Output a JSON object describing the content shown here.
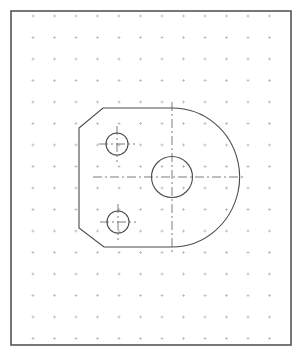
{
  "sheet": {
    "title": "Isometric dot-grid drawing sheet",
    "width": 303,
    "height": 359,
    "background_color": "#ffffff",
    "border": {
      "name": "sheet-border",
      "x": 11,
      "y": 11,
      "width": 280,
      "height": 334,
      "stroke_color": "#555555",
      "stroke_width": 1.6,
      "fill": "none"
    },
    "grid": {
      "name": "dot-grid",
      "marker": "plus-tick",
      "origin_x": 33,
      "origin_y": 16,
      "spacing_x": 21.5,
      "spacing_y": 21.5,
      "columns": 12,
      "rows": 16,
      "tick_length": 3,
      "stroke_color": "#b9b9b9",
      "stroke_width": 0.8
    }
  },
  "drawing": {
    "name": "d-shaped-bracket-plate",
    "line_color": "#4a4a4a",
    "line_width": 1.1,
    "center_line_color": "#6e6e6e",
    "center_line_width": 0.9,
    "center_line_dash": "9 3 2 3",
    "outline": {
      "name": "part-outline",
      "description": "Chamfered rectangle on the left closed by a large D arc on the right",
      "path": "M 103 108 L 172 108 C 205 108 231 131 238 162 C 240 171 240 183 238 192 C 231 223 205 247 172 247 L 104 247 L 79 228 L 79 128 Z",
      "vertices": [
        [
          103,
          108
        ],
        [
          172,
          108
        ],
        [
          238,
          177
        ],
        [
          172,
          247
        ],
        [
          104,
          247
        ],
        [
          79,
          228
        ],
        [
          79,
          128
        ]
      ],
      "top_edge_y": 108,
      "bottom_edge_y": 247,
      "left_edge_x": 79,
      "right_extreme_x": 240,
      "chamfer_top_left": {
        "from": [
          79,
          128
        ],
        "to": [
          103,
          108
        ]
      },
      "chamfer_bottom_left": {
        "from": [
          79,
          228
        ],
        "to": [
          104,
          247
        ]
      }
    },
    "circles": [
      {
        "name": "center-bore",
        "role": "main-bore",
        "cx": 172,
        "cy": 177,
        "r": 20.5
      },
      {
        "name": "upper-mounting-hole",
        "role": "fastener-hole",
        "cx": 117,
        "cy": 144,
        "r": 11
      },
      {
        "name": "lower-mounting-hole",
        "role": "fastener-hole",
        "cx": 118,
        "cy": 222,
        "r": 11
      }
    ],
    "center_lines": [
      {
        "name": "main-horizontal-centerline",
        "orientation": "horizontal",
        "x1": 93,
        "y1": 177,
        "x2": 243,
        "y2": 177
      },
      {
        "name": "main-vertical-centerline",
        "orientation": "vertical",
        "x1": 172,
        "y1": 102,
        "x2": 172,
        "y2": 252
      },
      {
        "name": "upper-hole-horizontal-centerline",
        "orientation": "horizontal",
        "x1": 99,
        "y1": 144,
        "x2": 135,
        "y2": 144
      },
      {
        "name": "upper-hole-vertical-centerline",
        "orientation": "vertical",
        "x1": 117,
        "y1": 126,
        "x2": 117,
        "y2": 162
      },
      {
        "name": "lower-hole-horizontal-centerline",
        "orientation": "horizontal",
        "x1": 100,
        "y1": 222,
        "x2": 136,
        "y2": 222
      },
      {
        "name": "lower-hole-vertical-centerline",
        "orientation": "vertical",
        "x1": 118,
        "y1": 204,
        "x2": 118,
        "y2": 240
      }
    ]
  },
  "artifacts": {
    "top_left_smudge": {
      "name": "scan-smudge",
      "visible": true,
      "description": "faint gray scan artifact above the sheet border"
    }
  }
}
